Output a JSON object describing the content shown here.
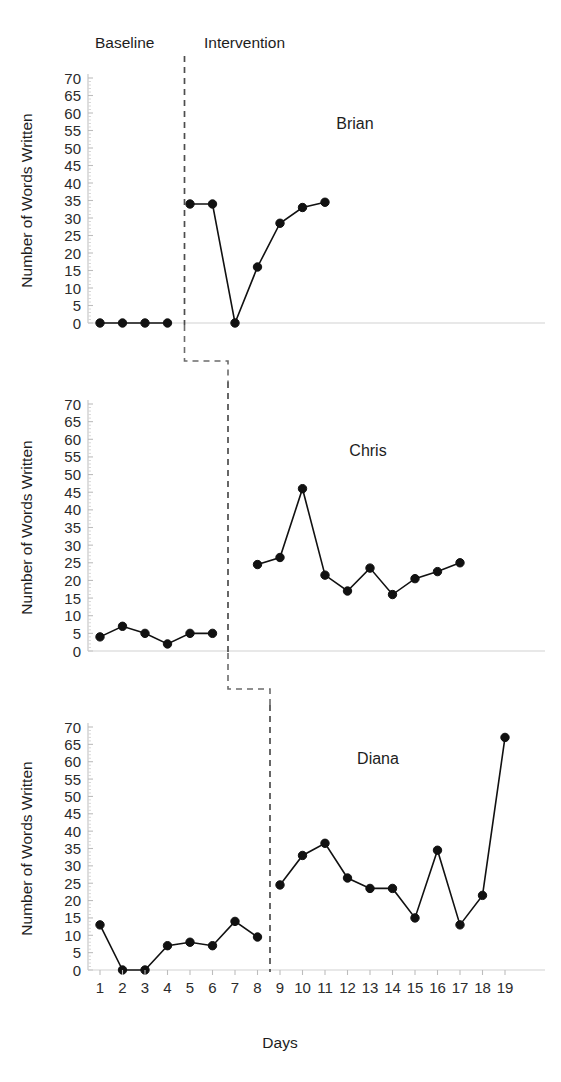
{
  "chart_data": {
    "type": "line",
    "title": "",
    "xlabel": "Days",
    "ylabel": "Number of Words Written",
    "ylim": [
      0,
      70
    ],
    "ytick_step": 5,
    "yticks": [
      0,
      5,
      10,
      15,
      20,
      25,
      30,
      35,
      40,
      45,
      50,
      55,
      60,
      65,
      70
    ],
    "xlim": [
      1,
      19
    ],
    "xticks": [
      1,
      2,
      3,
      4,
      5,
      6,
      7,
      8,
      9,
      10,
      11,
      12,
      13,
      14,
      15,
      16,
      17,
      18,
      19
    ],
    "grid": false,
    "legend": "none",
    "design": "multiple-baseline across participants",
    "phase_labels": {
      "baseline": "Baseline",
      "intervention": "Intervention"
    },
    "panels": [
      {
        "name": "Brian",
        "phase_change_after_day": 4,
        "baseline": {
          "x": [
            1,
            2,
            3,
            4
          ],
          "y": [
            0,
            0,
            0,
            0
          ]
        },
        "intervention": {
          "x": [
            5,
            6,
            7,
            8,
            9,
            10,
            11
          ],
          "y": [
            34,
            34,
            0,
            16,
            28.5,
            33,
            34.5
          ]
        }
      },
      {
        "name": "Chris",
        "phase_change_after_day": 7,
        "baseline": {
          "x": [
            1,
            2,
            3,
            4,
            5,
            6
          ],
          "y": [
            4,
            7,
            5,
            2,
            5,
            5
          ]
        },
        "intervention": {
          "x": [
            8,
            9,
            10,
            11,
            12,
            13,
            14,
            15,
            16,
            17
          ],
          "y": [
            24.5,
            26.5,
            46,
            21.5,
            17,
            23.5,
            16,
            20.5,
            22.5,
            25
          ]
        }
      },
      {
        "name": "Diana",
        "phase_change_after_day": 8,
        "baseline": {
          "x": [
            1,
            2,
            3,
            4,
            5,
            6,
            7,
            8
          ],
          "y": [
            13,
            0,
            0,
            7,
            8,
            7,
            14,
            9.5
          ]
        },
        "intervention": {
          "x": [
            9,
            10,
            11,
            12,
            13,
            14,
            15,
            16,
            17,
            18,
            19
          ],
          "y": [
            24.5,
            33,
            36.5,
            26.5,
            23.5,
            23.5,
            15,
            34.5,
            13,
            21.5,
            67
          ]
        }
      }
    ],
    "colors": {
      "line": "#111111",
      "marker": "#111111",
      "phase_line": "#4d4d4d",
      "axis": "#c9c9c9",
      "text": "#1d1d1d",
      "background": "#ffffff"
    }
  }
}
